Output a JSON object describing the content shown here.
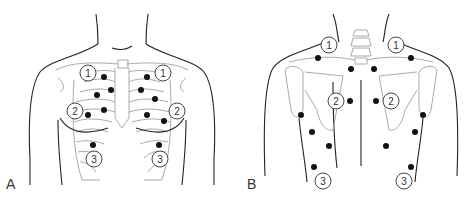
{
  "figure": {
    "panels": [
      {
        "id": "A",
        "label": "A",
        "view": "anterior chest",
        "markers": [
          {
            "label": "1",
            "side": "right"
          },
          {
            "label": "1",
            "side": "left"
          },
          {
            "label": "2",
            "side": "right"
          },
          {
            "label": "2",
            "side": "left"
          },
          {
            "label": "3",
            "side": "right"
          },
          {
            "label": "3",
            "side": "left"
          }
        ],
        "point_count": 12
      },
      {
        "id": "B",
        "label": "B",
        "view": "posterior chest",
        "markers": [
          {
            "label": "1",
            "side": "left"
          },
          {
            "label": "1",
            "side": "right"
          },
          {
            "label": "2",
            "side": "left"
          },
          {
            "label": "2",
            "side": "right"
          },
          {
            "label": "3",
            "side": "left"
          },
          {
            "label": "3",
            "side": "right"
          }
        ],
        "point_count": 14
      }
    ],
    "colors": {
      "outline": "#222222",
      "bone": "#9a9a9a",
      "point": "#111111",
      "background": "#ffffff"
    }
  }
}
